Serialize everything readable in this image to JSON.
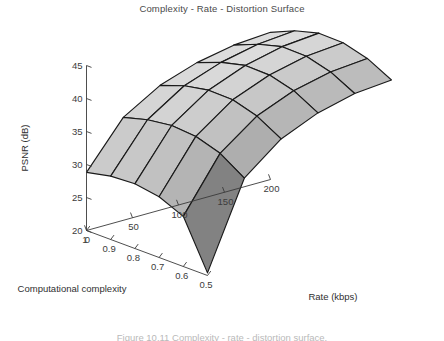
{
  "title": "Complexity - Rate - Distortion Surface",
  "caption": "Figure 10.11  Complexity - rate - distortion surface.",
  "chart_data": {
    "type": "surface",
    "title": "Complexity - Rate - Distortion Surface",
    "xlabel": "Computational complexity",
    "ylabel": "Rate (kbps)",
    "zlabel": "PSNR (dB)",
    "grid": false,
    "legend": "none",
    "colormap": "gray",
    "x_name": "Computational complexity",
    "x_ticks": [
      1,
      0.9,
      0.8,
      0.7,
      0.6,
      0.5
    ],
    "x_tick_labels": [
      "1",
      "0.9",
      "0.8",
      "0.7",
      "0.6",
      "0.5"
    ],
    "xlim": [
      0.5,
      1
    ],
    "y_name": "Rate (kbps)",
    "y_ticks": [
      0,
      50,
      100,
      150,
      200
    ],
    "y_tick_labels": [
      "0",
      "50",
      "100",
      "150",
      "200"
    ],
    "ylim": [
      0,
      200
    ],
    "z_name": "PSNR (dB)",
    "z_ticks": [
      20,
      25,
      30,
      35,
      40,
      45
    ],
    "z_tick_labels": [
      "20",
      "25",
      "30",
      "35",
      "40",
      "45"
    ],
    "zlim": [
      20,
      45
    ],
    "complexity_values": [
      1.0,
      0.9,
      0.8,
      0.7,
      0.6,
      0.5
    ],
    "rate_values": [
      0,
      40,
      80,
      120,
      160,
      200
    ],
    "psnr_grid": [
      [
        28.8,
        35.6,
        38.9,
        40.8,
        41.9,
        42.3
      ],
      [
        29.6,
        36.6,
        40.2,
        42.2,
        43.4,
        43.9
      ],
      [
        29.8,
        37.1,
        40.9,
        43.1,
        44.4,
        44.9
      ],
      [
        29.2,
        36.8,
        40.8,
        43.0,
        44.3,
        44.8
      ],
      [
        27.6,
        35.6,
        39.7,
        42.0,
        43.3,
        43.8
      ],
      [
        20.4,
        33.2,
        37.6,
        40.0,
        41.4,
        41.9
      ]
    ],
    "surface_description": "Dome-shaped complexity-rate-distortion surface rising steeply with rate and peaking near mid complexity, with a sharp dip at the low-rate low-complexity front corner.",
    "shade_min_hex": "#1f1f1f",
    "shade_max_hex": "#dcdcdc"
  }
}
